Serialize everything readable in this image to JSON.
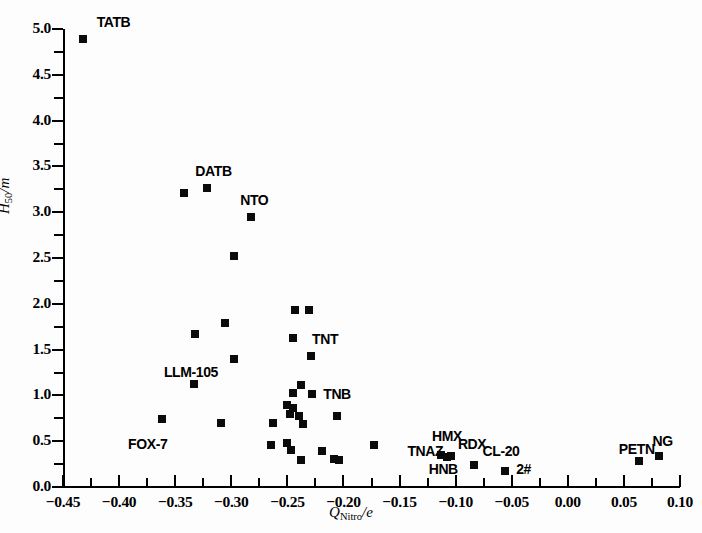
{
  "figure": {
    "background": "#ffffff",
    "marker_color": "#0b0b0b"
  },
  "chart_data": {
    "type": "scatter",
    "title": "",
    "xlabel": "Q_Nitro/e",
    "ylabel": "H50/m",
    "xlabel_parts": {
      "base": "Q",
      "sub": "Nitro",
      "tail": "/e"
    },
    "ylabel_parts": {
      "base": "H",
      "sub": "50",
      "tail": "/m"
    },
    "xlim": [
      -0.45,
      0.1
    ],
    "ylim": [
      0.0,
      5.0
    ],
    "grid": false,
    "legend": "none",
    "xticks": [
      -0.45,
      -0.4,
      -0.35,
      -0.3,
      -0.25,
      -0.2,
      -0.15,
      -0.1,
      -0.05,
      0.0,
      0.05,
      0.1
    ],
    "xticklabels": [
      "−0.45",
      "−0.40",
      "−0.35",
      "−0.30",
      "−0.25",
      "−0.20",
      "−0.15",
      "−0.10",
      "−0.05",
      "0.00",
      "0.05",
      "0.10"
    ],
    "xminor_step": 0.025,
    "yticks": [
      0.0,
      0.5,
      1.0,
      1.5,
      2.0,
      2.5,
      3.0,
      3.5,
      4.0,
      4.5,
      5.0
    ],
    "yticklabels": [
      "0.0",
      "0.5",
      "1.0",
      "1.5",
      "2.0",
      "2.5",
      "3.0",
      "3.5",
      "4.0",
      "4.5",
      "5.0"
    ],
    "yminor_step": 0.25,
    "points": [
      {
        "x": -0.432,
        "y": 4.89
      },
      {
        "x": -0.342,
        "y": 3.21
      },
      {
        "x": -0.322,
        "y": 3.26
      },
      {
        "x": -0.282,
        "y": 2.95
      },
      {
        "x": -0.298,
        "y": 2.52
      },
      {
        "x": -0.243,
        "y": 1.93
      },
      {
        "x": -0.231,
        "y": 1.93
      },
      {
        "x": -0.306,
        "y": 1.79
      },
      {
        "x": -0.332,
        "y": 1.67
      },
      {
        "x": -0.245,
        "y": 1.63
      },
      {
        "x": -0.229,
        "y": 1.43
      },
      {
        "x": -0.298,
        "y": 1.4
      },
      {
        "x": -0.238,
        "y": 1.11
      },
      {
        "x": -0.333,
        "y": 1.12
      },
      {
        "x": -0.245,
        "y": 1.03
      },
      {
        "x": -0.228,
        "y": 1.02
      },
      {
        "x": -0.25,
        "y": 0.89
      },
      {
        "x": -0.245,
        "y": 0.86
      },
      {
        "x": -0.248,
        "y": 0.8
      },
      {
        "x": -0.24,
        "y": 0.78
      },
      {
        "x": -0.206,
        "y": 0.78
      },
      {
        "x": -0.263,
        "y": 0.7
      },
      {
        "x": -0.236,
        "y": 0.69
      },
      {
        "x": -0.309,
        "y": 0.7
      },
      {
        "x": -0.362,
        "y": 0.74
      },
      {
        "x": -0.265,
        "y": 0.46
      },
      {
        "x": -0.25,
        "y": 0.48
      },
      {
        "x": -0.247,
        "y": 0.4
      },
      {
        "x": -0.238,
        "y": 0.3
      },
      {
        "x": -0.219,
        "y": 0.39
      },
      {
        "x": -0.208,
        "y": 0.31
      },
      {
        "x": -0.204,
        "y": 0.29
      },
      {
        "x": -0.173,
        "y": 0.46
      },
      {
        "x": -0.113,
        "y": 0.35
      },
      {
        "x": -0.108,
        "y": 0.33
      },
      {
        "x": -0.104,
        "y": 0.34
      },
      {
        "x": -0.084,
        "y": 0.24
      },
      {
        "x": -0.056,
        "y": 0.18
      },
      {
        "x": 0.0636,
        "y": 0.28
      },
      {
        "x": 0.0815,
        "y": 0.34
      }
    ],
    "annotations": [
      {
        "text": "TATB",
        "x": -0.42,
        "y": 5.08,
        "anchor": "left"
      },
      {
        "text": "DATB",
        "x": -0.332,
        "y": 3.45,
        "anchor": "left"
      },
      {
        "text": "NTO",
        "x": -0.292,
        "y": 3.13,
        "anchor": "left"
      },
      {
        "text": "TNT",
        "x": -0.228,
        "y": 1.62,
        "anchor": "left"
      },
      {
        "text": "LLM-105",
        "x": -0.36,
        "y": 1.26,
        "anchor": "left"
      },
      {
        "text": "TNB",
        "x": -0.218,
        "y": 1.02,
        "anchor": "left"
      },
      {
        "text": "FOX-7",
        "x": -0.392,
        "y": 0.47,
        "anchor": "left"
      },
      {
        "text": "TNAZ",
        "x": -0.143,
        "y": 0.39,
        "anchor": "left"
      },
      {
        "text": "HMX",
        "x": -0.121,
        "y": 0.56,
        "anchor": "left"
      },
      {
        "text": "HNB",
        "x": -0.124,
        "y": 0.2,
        "anchor": "left"
      },
      {
        "text": "RDX",
        "x": -0.098,
        "y": 0.47,
        "anchor": "left"
      },
      {
        "text": "CL-20",
        "x": -0.076,
        "y": 0.39,
        "anchor": "left"
      },
      {
        "text": "2#",
        "x": -0.046,
        "y": 0.2,
        "anchor": "left"
      },
      {
        "text": "PETN",
        "x": 0.0455,
        "y": 0.41,
        "anchor": "left"
      },
      {
        "text": "NG",
        "x": 0.0755,
        "y": 0.5,
        "anchor": "left"
      }
    ]
  }
}
